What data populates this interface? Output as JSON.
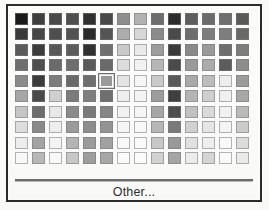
{
  "dialog": {
    "name": "color-picker-popup",
    "frame_color": "#2b2b2b",
    "background_color": "#fcfcfb"
  },
  "grid": {
    "columns": 14,
    "rows": 10,
    "selected_row": 4,
    "selected_col": 5,
    "selected_color": "#9a9a9a",
    "swatch_colors": [
      [
        "#1a1a1a",
        "#3f3f3f",
        "#4b4b4b",
        "#4f4f4f",
        "#2f2f2f",
        "#4a4a4a",
        "#8f8f8f",
        "#b3b3b3",
        "#6e6e6e",
        "#2c2c2c",
        "#5e5e5e",
        "#6b6b6b",
        "#6f6f6f",
        "#5a5a5a"
      ],
      [
        "#3a3a3a",
        "#474747",
        "#4f4f4f",
        "#525252",
        "#2a2a2a",
        "#555555",
        "#adadad",
        "#d8d8d8",
        "#8c8c8c",
        "#4a4a4a",
        "#6e6e6e",
        "#7d7d7d",
        "#7f7f7f",
        "#6a6a6a"
      ],
      [
        "#5b5b5b",
        "#3c3c3c",
        "#585858",
        "#5b5b5b",
        "#303030",
        "#707070",
        "#c9c9c9",
        "#eaeaea",
        "#9d9d9d",
        "#3a3a3a",
        "#8a8a8a",
        "#9a9a9a",
        "#6d6d6d",
        "#7d7d7d"
      ],
      [
        "#6f6f6f",
        "#4f4f4f",
        "#6b6b6b",
        "#6e6e6e",
        "#5a5a5a",
        "#6a6a6a",
        "#dcdcdc",
        "#f2f2f2",
        "#b6b6b6",
        "#4b4b4b",
        "#9a9a9a",
        "#ababab",
        "#5c5c5c",
        "#8d8d8d"
      ],
      [
        "#8a8a8a",
        "#3b3b3b",
        "#7d7d7d",
        "#6a6a6a",
        "#6e6e6e",
        "#9a9a9a",
        "#e4e4e4",
        "#f6f6f6",
        "#c9c9c9",
        "#5a5a5a",
        "#a9a9a9",
        "#bcbcbc",
        "#ededed",
        "#9c9c9c"
      ],
      [
        "#a6a6a6",
        "#4a4a4a",
        "#d0d0d0",
        "#7b7b7b",
        "#7e7e7e",
        "#6f6f6f",
        "#eeeeee",
        "#f4f4f4",
        "#9d9d9d",
        "#3f3f3f",
        "#b5b5b5",
        "#cfcfcf",
        "#f0f0f0",
        "#a8a8a8"
      ],
      [
        "#c6c6c6",
        "#6e6e6e",
        "#e9e9e9",
        "#8b8b8b",
        "#7a7a7a",
        "#868686",
        "#f2f2f2",
        "#f7f7f7",
        "#a7a7a7",
        "#4e4e4e",
        "#c2c2c2",
        "#dadada",
        "#f2f2f2",
        "#bcbcbc"
      ],
      [
        "#dedede",
        "#8a8a8a",
        "#f0f0f0",
        "#9c9c9c",
        "#8e8e8e",
        "#949494",
        "#f6f6f6",
        "#fafafa",
        "#b7b7b7",
        "#7b7b7b",
        "#d2d2d2",
        "#e6e6e6",
        "#f6f6f6",
        "#cdcdcd"
      ],
      [
        "#efefef",
        "#a4a4a4",
        "#f6f6f6",
        "#b6b6b6",
        "#9d9d9d",
        "#a2a2a2",
        "#fafafa",
        "#fcfcfc",
        "#c9c9c9",
        "#9a9a9a",
        "#e2e2e2",
        "#f0f0f0",
        "#fafafa",
        "#dedede"
      ],
      [
        "#fafafa",
        "#b9b9b9",
        "#fbfbfb",
        "#c9c9c9",
        "#9f9f9f",
        "#a8a8a8",
        "#fdfdfd",
        "#fefefe",
        "#d4d4d4",
        "#a6a6a6",
        "#eeeeee",
        "#d7d7d7",
        "#fdfdfd",
        "#ececec"
      ]
    ]
  },
  "footer": {
    "other_label": "Other...",
    "separator_color": "#6b6b6b"
  }
}
